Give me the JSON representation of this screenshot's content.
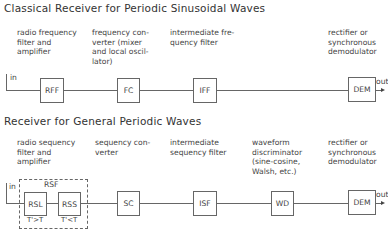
{
  "classical": {
    "title": "Classical Receiver for Periodic Sinusoidal Waves",
    "descriptions": {
      "rff": "radio frequency\nfilter and\namplifier",
      "fc": "frequency con-\nverter (mixer\nand local oscil-\nlator)",
      "iff": "intermediate fre-\nquency filter",
      "dem": "rectifier or\nsynchronous\ndemodulator"
    },
    "blocks": {
      "rff": "RFF",
      "fc": "FC",
      "iff": "IFF",
      "dem": "DEM"
    },
    "input_label": "in",
    "output_label": "out"
  },
  "general": {
    "title": "Receiver for General Periodic Waves",
    "descriptions": {
      "rsf": "radio sequency\nfilter and\namplifier",
      "sc": "sequency con-\nverter",
      "isf": "intermediate\nsequency filter",
      "wd": "waveform\ndiscriminator\n(sine-cosine,\nWalsh, etc.)",
      "dem": "rectifier or\nsynchronous\ndemodulator"
    },
    "blocks": {
      "rsl": "RSL",
      "rss": "RSS",
      "sc": "SC",
      "isf": "ISF",
      "wd": "WD",
      "dem": "DEM"
    },
    "group_label": "RSF",
    "rsl_cond": "T'>T",
    "rss_cond": "T'<T",
    "input_label": "in",
    "output_label": "out"
  }
}
